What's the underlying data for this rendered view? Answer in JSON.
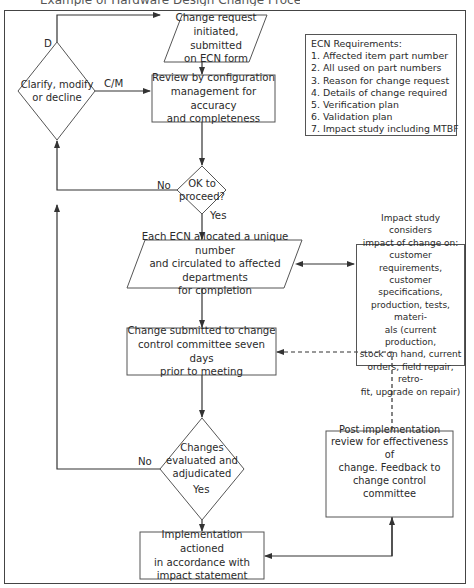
{
  "title": "Example of Hardware Design Change Process",
  "nodes": {
    "change_request": "Change request\ninitiated, submitted\non ECN form",
    "review": "Review by configuration\nmanagement for accuracy\nand completeness",
    "clarify": "Clarify, modify\nor decline",
    "ok_to_proceed": "OK to\nproceed?",
    "allocate": "Each ECN allocated a unique number\nand circulated to affected departments\nfor completion",
    "impact_study": "Impact study considers\nimpact of change on:\ncustomer requirements,\ncustomer specifications,\nproduction, tests, materi-\nals (current production,\nstock on hand, current\norders, field repair, retro-\nfit, upgrade on repair)",
    "submitted": "Change submitted to change\ncontrol committee seven days\nprior to meeting",
    "evaluated": "Changes\nevaluated and\nadjudicated",
    "implementation": "Implementation actioned\nin accordance with\nimpact statement",
    "post_review": "Post implementation\nreview for effectiveness of\nchange. Feedback to\nchange control committee"
  },
  "labels": {
    "d": "D",
    "cm": "C/M",
    "no_ok": "No",
    "yes_ok": "Yes",
    "no_eval": "No",
    "yes_eval": "Yes"
  },
  "ecn_requirements": {
    "heading": "ECN Requirements:",
    "items": [
      "1. Affected item part number",
      "2. All used on part numbers",
      "3. Reason for change request",
      "4. Details of change required",
      "5. Verification plan",
      "6. Validation plan",
      "7. Impact study including MTBF"
    ]
  },
  "colors": {
    "line": "#333333",
    "border": "#555555",
    "text": "#2a2a2a",
    "background": "#ffffff"
  }
}
